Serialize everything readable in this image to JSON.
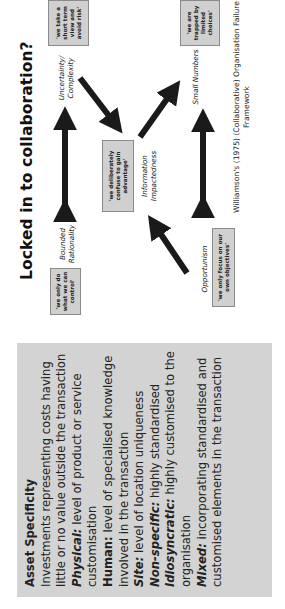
{
  "slide": {
    "title": "Locked in to collaboration?",
    "asset_box": {
      "heading": "Asset Specificity",
      "intro": "Investments representing costs having little or no value outside the transaction",
      "items": [
        {
          "term": "Physical:",
          "desc": " level of product or service customisation",
          "style": "bold-italic"
        },
        {
          "term": "Human:",
          "desc": " level of specialised knowledge involved in the transaction",
          "style": "bold"
        },
        {
          "term": "Site:",
          "desc": " level of location uniqueness",
          "style": "bold-italic"
        },
        {
          "term": "Non-specific:",
          "desc": " highly standardised",
          "style": "bold-italic"
        },
        {
          "term": "Idiosyncratic:",
          "desc": " highly customised to the organisation",
          "style": "bold-italic"
        },
        {
          "term": "Mixed:",
          "desc": " incorporating standardised and customised elements in the transaction",
          "style": "bold-italic"
        }
      ]
    },
    "diagram": {
      "nodes": {
        "uncertainty": "Uncertainty/ Complexity",
        "bounded": "Bounded Rationality",
        "information": "Information Impactedness",
        "small_numbers": "Small Numbers",
        "opportunism": "Opportunism"
      },
      "quotes": {
        "uncertainty": "'we take a short term view and avoid risk'",
        "bounded": "'we only do what we can control'",
        "information": "'we deliberately confuse to gain advantage'",
        "small_numbers": "'we are trapped by limited choices'",
        "opportunism": "'we only focus on our own objectives'"
      },
      "caption": "Williamson's (1975) (Collaborative) Organisation Failure Framework"
    },
    "colors": {
      "box_fill": "#d3d3d3",
      "quote_fill": "#d0d0d0",
      "arrow": "#1a1a1a"
    }
  }
}
